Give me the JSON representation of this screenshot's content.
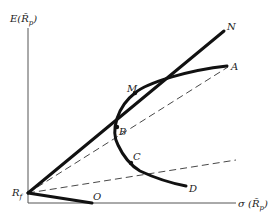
{
  "diagram": {
    "y_axis_label": "E(R̃p)",
    "y_axis_label_main": "E(R̃",
    "y_axis_label_sub": "p",
    "y_axis_label_close": ")",
    "x_axis_label_main": "σ (R̃",
    "x_axis_label_sub": "p",
    "x_axis_label_close": ")",
    "points": {
      "rf": {
        "label_main": "R",
        "label_sub": "f"
      },
      "N": {
        "label": "N"
      },
      "A": {
        "label": "A"
      },
      "M": {
        "label": "M"
      },
      "B": {
        "label": "B"
      },
      "C": {
        "label": "C"
      },
      "D": {
        "label": "D"
      },
      "O": {
        "label": "O"
      }
    },
    "lines": [
      {
        "name": "capital-market-line",
        "from": "Rf",
        "to": "N",
        "style": "solid-thick"
      },
      {
        "name": "borrowing-line",
        "from": "Rf",
        "to": "O",
        "style": "solid-thick"
      },
      {
        "name": "efficient-frontier-curve",
        "through": [
          "A",
          "M",
          "B",
          "C",
          "D"
        ],
        "style": "solid-thick"
      },
      {
        "name": "line-rf-b-a",
        "from": "Rf",
        "through": "B",
        "to": "A",
        "style": "dashed"
      },
      {
        "name": "line-rf-c",
        "from": "Rf",
        "through": "C",
        "style": "dashed"
      }
    ]
  }
}
